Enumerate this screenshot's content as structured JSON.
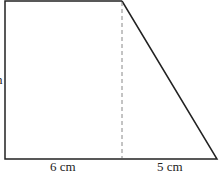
{
  "diagram": {
    "shape": "right trapezoid",
    "labels": {
      "bottom_left": "6 cm",
      "bottom_right": "5 cm",
      "left_partial": "n"
    },
    "colors": {
      "stroke": "#222222",
      "dashed": "#888888"
    }
  }
}
